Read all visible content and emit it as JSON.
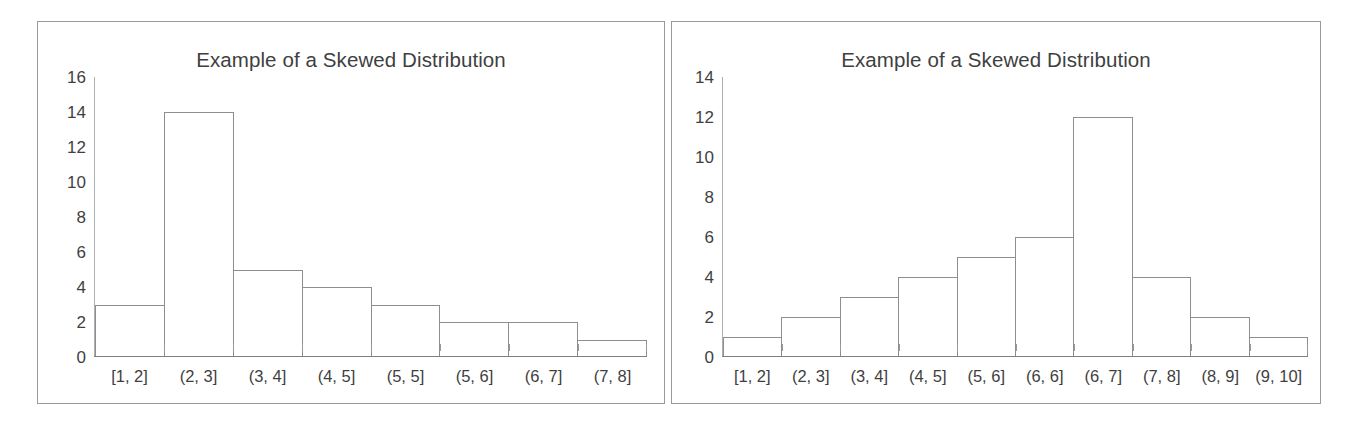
{
  "figure": {
    "background_color": "#ffffff",
    "panel_border_color": "#9a9a9a",
    "text_color": "#3f3f3f",
    "bar_outline_color": "#8e8e8e",
    "bar_fill_color": "#ffffff",
    "axis_color": "#808080"
  },
  "charts": [
    {
      "id": "left",
      "title": "Example of a Skewed Distribution",
      "y_ticks": [
        "16",
        "14",
        "12",
        "10",
        "8",
        "6",
        "4",
        "2",
        "0"
      ],
      "x_labels": [
        "[1, 2]",
        "(2, 3]",
        "(3, 4]",
        "(4, 5]",
        "(5, 5]",
        "(5, 6]",
        "(6, 7]",
        "(7, 8]"
      ],
      "values": [
        3,
        14,
        5,
        4,
        3,
        2,
        2,
        1
      ]
    },
    {
      "id": "right",
      "title": "Example of a Skewed Distribution",
      "y_ticks": [
        "14",
        "12",
        "10",
        "8",
        "6",
        "4",
        "2",
        "0"
      ],
      "x_labels": [
        "[1, 2]",
        "(2, 3]",
        "(3, 4]",
        "(4, 5]",
        "(5, 6]",
        "(6, 6]",
        "(6, 7]",
        "(7, 8]",
        "(8, 9]",
        "(9, 10]"
      ],
      "values": [
        1,
        2,
        3,
        4,
        5,
        6,
        12,
        4,
        2,
        1
      ]
    }
  ],
  "chart_data": [
    {
      "type": "bar",
      "title": "Example of a Skewed Distribution",
      "subtitle": "",
      "xlabel": "",
      "ylabel": "",
      "categories": [
        "[1, 2]",
        "(2, 3]",
        "(3, 4]",
        "(4, 5]",
        "(5, 5]",
        "(5, 6]",
        "(6, 7]",
        "(7, 8]"
      ],
      "values": [
        3,
        14,
        5,
        4,
        3,
        2,
        2,
        1
      ],
      "ylim": [
        0,
        16
      ],
      "ytick_values": [
        0,
        2,
        4,
        6,
        8,
        10,
        12,
        14,
        16
      ],
      "grid": false,
      "legend": "none",
      "style": "histogram-contiguous-bars-white-fill"
    },
    {
      "type": "bar",
      "title": "Example of a Skewed Distribution",
      "subtitle": "",
      "xlabel": "",
      "ylabel": "",
      "categories": [
        "[1, 2]",
        "(2, 3]",
        "(3, 4]",
        "(4, 5]",
        "(5, 6]",
        "(6, 6]",
        "(6, 7]",
        "(7, 8]",
        "(8, 9]",
        "(9, 10]"
      ],
      "values": [
        1,
        2,
        3,
        4,
        5,
        6,
        12,
        4,
        2,
        1
      ],
      "ylim": [
        0,
        14
      ],
      "ytick_values": [
        0,
        2,
        4,
        6,
        8,
        10,
        12,
        14
      ],
      "grid": false,
      "legend": "none",
      "style": "histogram-contiguous-bars-white-fill"
    }
  ]
}
